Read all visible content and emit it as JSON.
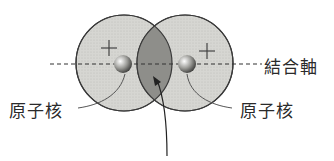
{
  "diagram": {
    "title_partial": "",
    "labels": {
      "bond_axis": "結合軸",
      "nucleus_left": "原子核",
      "nucleus_right": "原子核"
    },
    "signs": {
      "left_orbital": "+",
      "right_orbital": "+"
    },
    "colors": {
      "orbital_fill": "#d4d4d0",
      "overlap_fill": "#8e8e8a",
      "outline": "#3a3a3a",
      "nucleus": "#9a9a96"
    }
  }
}
